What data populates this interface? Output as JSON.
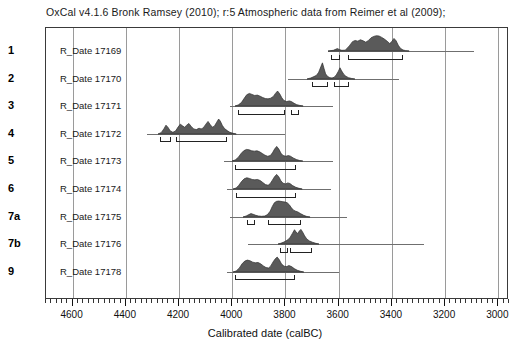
{
  "title": "OxCal v4.1.6 Bronk Ramsey (2010); r:5 Atmospheric data from Reimer et al (2009);",
  "axis": {
    "label": "Calibrated date (calBC)",
    "ticks": [
      4600,
      4400,
      4200,
      4000,
      3800,
      3600,
      3400,
      3200,
      3000
    ],
    "minor_step": 20
  },
  "colors": {
    "fill": "#5a5a5a",
    "outline": "#2e2e2e",
    "grid": "#9a9a9a",
    "frame": "#3a3a3a",
    "baseline": "#6f6f6f"
  },
  "chart_data": {
    "type": "area",
    "title": "OxCal v4.1.6 Bronk Ramsey (2010); r:5 Atmospheric data from Reimer et al (2009);",
    "xlabel": "Calibrated date (calBC)",
    "ylabel": "",
    "xlim": [
      4700,
      2960
    ],
    "x_direction": "decreasing",
    "grid": true,
    "legend": false,
    "categories": [
      "1",
      "2",
      "3",
      "4",
      "5",
      "6",
      "7a",
      "7b",
      "9"
    ],
    "series": [
      {
        "index": "1",
        "name": "R_Date 17169",
        "whisker": [
          3640,
          3090
        ],
        "curve": [
          [
            3640,
            0.0
          ],
          [
            3620,
            0.04
          ],
          [
            3605,
            0.14
          ],
          [
            3596,
            0.08
          ],
          [
            3588,
            0.04
          ],
          [
            3575,
            0.05
          ],
          [
            3560,
            0.3
          ],
          [
            3548,
            0.55
          ],
          [
            3538,
            0.62
          ],
          [
            3528,
            0.58
          ],
          [
            3518,
            0.66
          ],
          [
            3508,
            0.6
          ],
          [
            3498,
            0.52
          ],
          [
            3488,
            0.62
          ],
          [
            3478,
            0.78
          ],
          [
            3468,
            0.86
          ],
          [
            3458,
            0.9
          ],
          [
            3448,
            0.88
          ],
          [
            3438,
            0.8
          ],
          [
            3428,
            0.7
          ],
          [
            3418,
            0.58
          ],
          [
            3408,
            0.44
          ],
          [
            3400,
            0.56
          ],
          [
            3392,
            0.74
          ],
          [
            3384,
            0.6
          ],
          [
            3376,
            0.34
          ],
          [
            3368,
            0.16
          ],
          [
            3358,
            0.06
          ],
          [
            3348,
            0.02
          ],
          [
            3335,
            0.0
          ]
        ],
        "ranges": [
          [
            3630,
            3595
          ],
          [
            3565,
            3360
          ]
        ]
      },
      {
        "index": "2",
        "name": "R_Date 17170",
        "whisker": [
          3790,
          3375
        ],
        "curve": [
          [
            3720,
            0.0
          ],
          [
            3706,
            0.06
          ],
          [
            3694,
            0.14
          ],
          [
            3684,
            0.22
          ],
          [
            3676,
            0.4
          ],
          [
            3668,
            0.72
          ],
          [
            3662,
            0.95
          ],
          [
            3656,
            0.62
          ],
          [
            3650,
            0.3
          ],
          [
            3642,
            0.14
          ],
          [
            3634,
            0.08
          ],
          [
            3626,
            0.06
          ],
          [
            3618,
            0.1
          ],
          [
            3610,
            0.24
          ],
          [
            3602,
            0.46
          ],
          [
            3596,
            0.66
          ],
          [
            3590,
            0.48
          ],
          [
            3582,
            0.28
          ],
          [
            3574,
            0.16
          ],
          [
            3564,
            0.08
          ],
          [
            3552,
            0.03
          ],
          [
            3540,
            0.0
          ]
        ],
        "ranges": [
          [
            3700,
            3640
          ],
          [
            3618,
            3560
          ]
        ]
      },
      {
        "index": "3",
        "name": "R_Date 17171",
        "whisker": [
          4010,
          3620
        ],
        "curve": [
          [
            3990,
            0.0
          ],
          [
            3978,
            0.06
          ],
          [
            3966,
            0.2
          ],
          [
            3956,
            0.44
          ],
          [
            3946,
            0.66
          ],
          [
            3936,
            0.74
          ],
          [
            3926,
            0.68
          ],
          [
            3916,
            0.62
          ],
          [
            3906,
            0.64
          ],
          [
            3896,
            0.58
          ],
          [
            3886,
            0.5
          ],
          [
            3876,
            0.44
          ],
          [
            3866,
            0.42
          ],
          [
            3856,
            0.46
          ],
          [
            3846,
            0.56
          ],
          [
            3838,
            0.74
          ],
          [
            3830,
            0.88
          ],
          [
            3822,
            0.72
          ],
          [
            3814,
            0.48
          ],
          [
            3806,
            0.32
          ],
          [
            3796,
            0.26
          ],
          [
            3786,
            0.3
          ],
          [
            3778,
            0.26
          ],
          [
            3768,
            0.16
          ],
          [
            3758,
            0.08
          ],
          [
            3746,
            0.03
          ],
          [
            3734,
            0.0
          ]
        ],
        "ranges": [
          [
            3980,
            3800
          ],
          [
            3778,
            3748
          ]
        ]
      },
      {
        "index": "4",
        "name": "R_Date 17172",
        "whisker": [
          4320,
          3800
        ],
        "curve": [
          [
            4280,
            0.0
          ],
          [
            4268,
            0.08
          ],
          [
            4258,
            0.3
          ],
          [
            4250,
            0.52
          ],
          [
            4242,
            0.38
          ],
          [
            4234,
            0.18
          ],
          [
            4224,
            0.1
          ],
          [
            4214,
            0.18
          ],
          [
            4204,
            0.42
          ],
          [
            4196,
            0.58
          ],
          [
            4188,
            0.48
          ],
          [
            4180,
            0.4
          ],
          [
            4172,
            0.52
          ],
          [
            4164,
            0.62
          ],
          [
            4156,
            0.46
          ],
          [
            4146,
            0.3
          ],
          [
            4136,
            0.26
          ],
          [
            4126,
            0.34
          ],
          [
            4118,
            0.3
          ],
          [
            4110,
            0.36
          ],
          [
            4100,
            0.58
          ],
          [
            4092,
            0.74
          ],
          [
            4084,
            0.56
          ],
          [
            4076,
            0.4
          ],
          [
            4068,
            0.46
          ],
          [
            4060,
            0.68
          ],
          [
            4052,
            0.88
          ],
          [
            4046,
            0.76
          ],
          [
            4038,
            0.5
          ],
          [
            4030,
            0.32
          ],
          [
            4020,
            0.2
          ],
          [
            4010,
            0.1
          ],
          [
            3998,
            0.04
          ],
          [
            3986,
            0.0
          ]
        ],
        "ranges": [
          [
            4272,
            4232
          ],
          [
            4212,
            4020
          ]
        ]
      },
      {
        "index": "5",
        "name": "R_Date 17173",
        "whisker": [
          4030,
          3620
        ],
        "curve": [
          [
            4000,
            0.0
          ],
          [
            3988,
            0.06
          ],
          [
            3976,
            0.22
          ],
          [
            3966,
            0.44
          ],
          [
            3956,
            0.6
          ],
          [
            3946,
            0.68
          ],
          [
            3936,
            0.66
          ],
          [
            3926,
            0.6
          ],
          [
            3916,
            0.58
          ],
          [
            3906,
            0.6
          ],
          [
            3896,
            0.54
          ],
          [
            3886,
            0.44
          ],
          [
            3876,
            0.34
          ],
          [
            3866,
            0.28
          ],
          [
            3856,
            0.32
          ],
          [
            3848,
            0.48
          ],
          [
            3840,
            0.7
          ],
          [
            3832,
            0.86
          ],
          [
            3824,
            0.7
          ],
          [
            3816,
            0.46
          ],
          [
            3808,
            0.32
          ],
          [
            3798,
            0.28
          ],
          [
            3788,
            0.32
          ],
          [
            3780,
            0.28
          ],
          [
            3770,
            0.18
          ],
          [
            3758,
            0.09
          ],
          [
            3746,
            0.03
          ],
          [
            3734,
            0.0
          ]
        ],
        "ranges": [
          [
            3988,
            3760
          ]
        ]
      },
      {
        "index": "6",
        "name": "R_Date 17174",
        "whisker": [
          4020,
          3630
        ],
        "curve": [
          [
            3996,
            0.0
          ],
          [
            3984,
            0.06
          ],
          [
            3974,
            0.22
          ],
          [
            3964,
            0.44
          ],
          [
            3954,
            0.6
          ],
          [
            3944,
            0.66
          ],
          [
            3934,
            0.62
          ],
          [
            3924,
            0.56
          ],
          [
            3914,
            0.54
          ],
          [
            3904,
            0.56
          ],
          [
            3894,
            0.5
          ],
          [
            3884,
            0.38
          ],
          [
            3874,
            0.26
          ],
          [
            3864,
            0.22
          ],
          [
            3856,
            0.32
          ],
          [
            3848,
            0.52
          ],
          [
            3840,
            0.72
          ],
          [
            3832,
            0.86
          ],
          [
            3824,
            0.72
          ],
          [
            3816,
            0.48
          ],
          [
            3808,
            0.34
          ],
          [
            3798,
            0.3
          ],
          [
            3790,
            0.36
          ],
          [
            3782,
            0.32
          ],
          [
            3772,
            0.2
          ],
          [
            3760,
            0.1
          ],
          [
            3748,
            0.04
          ],
          [
            3736,
            0.0
          ]
        ],
        "ranges": [
          [
            3986,
            3762
          ]
        ]
      },
      {
        "index": "7a",
        "name": "R_Date 17175",
        "whisker": [
          4010,
          3570
        ],
        "curve": [
          [
            3960,
            0.0
          ],
          [
            3948,
            0.06
          ],
          [
            3938,
            0.14
          ],
          [
            3930,
            0.2
          ],
          [
            3922,
            0.16
          ],
          [
            3912,
            0.1
          ],
          [
            3902,
            0.06
          ],
          [
            3890,
            0.04
          ],
          [
            3878,
            0.06
          ],
          [
            3868,
            0.14
          ],
          [
            3858,
            0.34
          ],
          [
            3850,
            0.62
          ],
          [
            3842,
            0.84
          ],
          [
            3834,
            0.92
          ],
          [
            3826,
            0.94
          ],
          [
            3818,
            0.92
          ],
          [
            3810,
            0.9
          ],
          [
            3802,
            0.88
          ],
          [
            3794,
            0.84
          ],
          [
            3786,
            0.72
          ],
          [
            3778,
            0.54
          ],
          [
            3770,
            0.4
          ],
          [
            3762,
            0.34
          ],
          [
            3754,
            0.3
          ],
          [
            3744,
            0.2
          ],
          [
            3732,
            0.1
          ],
          [
            3720,
            0.03
          ],
          [
            3708,
            0.0
          ]
        ],
        "ranges": [
          [
            3946,
            3914
          ],
          [
            3866,
            3740
          ]
        ]
      },
      {
        "index": "7b",
        "name": "R_Date 17176",
        "whisker": [
          3940,
          3280
        ],
        "curve": [
          [
            3830,
            0.0
          ],
          [
            3820,
            0.04
          ],
          [
            3810,
            0.1
          ],
          [
            3800,
            0.18
          ],
          [
            3792,
            0.26
          ],
          [
            3784,
            0.4
          ],
          [
            3776,
            0.62
          ],
          [
            3768,
            0.84
          ],
          [
            3762,
            0.7
          ],
          [
            3756,
            0.62
          ],
          [
            3750,
            0.76
          ],
          [
            3744,
            0.86
          ],
          [
            3738,
            0.72
          ],
          [
            3730,
            0.48
          ],
          [
            3722,
            0.3
          ],
          [
            3712,
            0.18
          ],
          [
            3700,
            0.1
          ],
          [
            3688,
            0.04
          ],
          [
            3676,
            0.0
          ]
        ],
        "ranges": [
          [
            3820,
            3792
          ],
          [
            3784,
            3700
          ]
        ]
      },
      {
        "index": "9",
        "name": "R_Date 17178",
        "whisker": [
          4020,
          3600
        ],
        "curve": [
          [
            3998,
            0.0
          ],
          [
            3986,
            0.06
          ],
          [
            3974,
            0.24
          ],
          [
            3964,
            0.48
          ],
          [
            3954,
            0.64
          ],
          [
            3944,
            0.7
          ],
          [
            3934,
            0.66
          ],
          [
            3924,
            0.58
          ],
          [
            3914,
            0.54
          ],
          [
            3904,
            0.56
          ],
          [
            3894,
            0.48
          ],
          [
            3884,
            0.36
          ],
          [
            3874,
            0.26
          ],
          [
            3864,
            0.24
          ],
          [
            3856,
            0.36
          ],
          [
            3848,
            0.58
          ],
          [
            3840,
            0.76
          ],
          [
            3832,
            0.88
          ],
          [
            3824,
            0.72
          ],
          [
            3816,
            0.48
          ],
          [
            3806,
            0.34
          ],
          [
            3796,
            0.32
          ],
          [
            3788,
            0.38
          ],
          [
            3778,
            0.32
          ],
          [
            3768,
            0.2
          ],
          [
            3756,
            0.1
          ],
          [
            3744,
            0.04
          ],
          [
            3732,
            0.0
          ]
        ],
        "ranges": [
          [
            3988,
            3766
          ]
        ]
      }
    ]
  }
}
